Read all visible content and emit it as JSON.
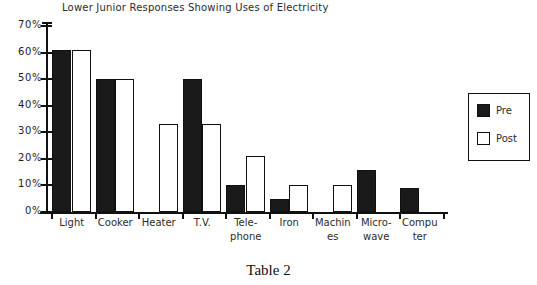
{
  "caption": "Table 2",
  "legend": {
    "position": "right",
    "items": [
      {
        "name": "Pre",
        "swatch": "filled-black-square-icon"
      },
      {
        "name": "Post",
        "swatch": "outlined-white-square-icon"
      }
    ]
  },
  "chart_data": {
    "type": "bar",
    "title": "Lower Junior Responses Showing Uses of Electricity",
    "xlabel": "",
    "ylabel": "",
    "ylim": [
      0,
      70
    ],
    "grid": false,
    "legend_position": "right",
    "ytick_labels": [
      "0%",
      "10%",
      "20%",
      "30%",
      "40%",
      "50%",
      "60%",
      "70%"
    ],
    "ytick_values": [
      0,
      10,
      20,
      30,
      40,
      50,
      60,
      70
    ],
    "categories": [
      "Light",
      "Cooker",
      "Heater",
      "T.V.",
      "Tele-phone",
      "Iron",
      "Machines",
      "Micro-wave",
      "Computer"
    ],
    "category_label_lines": [
      [
        "Light",
        ""
      ],
      [
        "Cooker",
        ""
      ],
      [
        "Heater",
        ""
      ],
      [
        "T.V.",
        ""
      ],
      [
        "Tele-",
        "phone"
      ],
      [
        "Iron",
        ""
      ],
      [
        "Machin",
        "es"
      ],
      [
        "Micro-",
        "wave"
      ],
      [
        "Compu",
        "ter"
      ]
    ],
    "series": [
      {
        "name": "Pre",
        "color": "#1a1a1a",
        "values": [
          61,
          50,
          0,
          50,
          10,
          5,
          0,
          16,
          9
        ]
      },
      {
        "name": "Post",
        "color": "#ffffff",
        "values": [
          61,
          50,
          33,
          33,
          21,
          10,
          10,
          0,
          0
        ]
      }
    ]
  }
}
